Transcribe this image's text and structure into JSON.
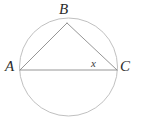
{
  "figure": {
    "kind": "inscribed-triangle-in-circle",
    "width": 141,
    "height": 124,
    "background_color": "#ffffff",
    "circle": {
      "center_x": 68.5,
      "center_y": 67,
      "radius": 49,
      "stroke_color": "#b9b9b9",
      "stroke_width": 0.9,
      "fill": "none"
    },
    "triangle": {
      "stroke_color": "#8a8a8a",
      "stroke_width": 0.9,
      "fill": "none",
      "points": "20,70 67,23 117,70"
    },
    "vertices": {
      "A": {
        "x": 20,
        "y": 70
      },
      "B": {
        "x": 67,
        "y": 23
      },
      "C": {
        "x": 117,
        "y": 70
      }
    },
    "labels": {
      "a": "A",
      "b": "B",
      "c": "C",
      "angle": "x"
    }
  }
}
